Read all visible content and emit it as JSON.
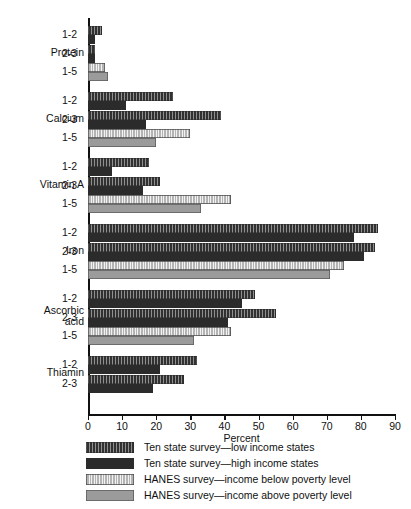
{
  "chart_data": {
    "type": "bar",
    "orientation": "horizontal",
    "title": "",
    "xlabel": "Percent",
    "ylabel": "",
    "xlim": [
      0,
      90
    ],
    "xticks": [
      0,
      10,
      20,
      30,
      40,
      50,
      60,
      70,
      80,
      90
    ],
    "xticklabels": [
      "0",
      "10",
      "20",
      "30",
      "40",
      "50",
      "60",
      "70",
      "80",
      "90"
    ],
    "grid": false,
    "legend_position": "below",
    "series": [
      {
        "name": "Ten state survey—low income states",
        "key": "tslow",
        "swatch": "dark-striped"
      },
      {
        "name": "Ten state survey—high income states",
        "key": "tshigh",
        "swatch": "dark-solid"
      },
      {
        "name": "HANES survey—income below poverty level",
        "key": "hbelow",
        "swatch": "light-striped"
      },
      {
        "name": "HANES survey—income above poverty level",
        "key": "habove",
        "swatch": "gray-solid"
      }
    ],
    "groups": [
      {
        "label": "Protein",
        "rows": [
          {
            "label": "1-2",
            "bars": [
              {
                "series": "tslow",
                "value": 4
              },
              {
                "series": "tshigh",
                "value": 2
              }
            ]
          },
          {
            "label": "2-3",
            "bars": [
              {
                "series": "tslow",
                "value": 2
              },
              {
                "series": "tshigh",
                "value": 2
              }
            ]
          },
          {
            "label": "1-5",
            "bars": [
              {
                "series": "hbelow",
                "value": 5
              },
              {
                "series": "habove",
                "value": 6
              }
            ]
          }
        ]
      },
      {
        "label": "Calcium",
        "rows": [
          {
            "label": "1-2",
            "bars": [
              {
                "series": "tslow",
                "value": 25
              },
              {
                "series": "tshigh",
                "value": 11
              }
            ]
          },
          {
            "label": "2-3",
            "bars": [
              {
                "series": "tslow",
                "value": 39
              },
              {
                "series": "tshigh",
                "value": 17
              }
            ]
          },
          {
            "label": "1-5",
            "bars": [
              {
                "series": "hbelow",
                "value": 30
              },
              {
                "series": "habove",
                "value": 20
              }
            ]
          }
        ]
      },
      {
        "label": "Vitamin A",
        "rows": [
          {
            "label": "1-2",
            "bars": [
              {
                "series": "tslow",
                "value": 18
              },
              {
                "series": "tshigh",
                "value": 7
              }
            ]
          },
          {
            "label": "2-3",
            "bars": [
              {
                "series": "tslow",
                "value": 21
              },
              {
                "series": "tshigh",
                "value": 16
              }
            ]
          },
          {
            "label": "1-5",
            "bars": [
              {
                "series": "hbelow",
                "value": 42
              },
              {
                "series": "habove",
                "value": 33
              }
            ]
          }
        ]
      },
      {
        "label": "Iron",
        "rows": [
          {
            "label": "1-2",
            "bars": [
              {
                "series": "tslow",
                "value": 85
              },
              {
                "series": "tshigh",
                "value": 78
              }
            ]
          },
          {
            "label": "2-3",
            "bars": [
              {
                "series": "tslow",
                "value": 84
              },
              {
                "series": "tshigh",
                "value": 81
              }
            ]
          },
          {
            "label": "1-5",
            "bars": [
              {
                "series": "hbelow",
                "value": 75
              },
              {
                "series": "habove",
                "value": 71
              }
            ]
          }
        ]
      },
      {
        "label": "Ascorbic\nacid",
        "rows": [
          {
            "label": "1-2",
            "bars": [
              {
                "series": "tslow",
                "value": 49
              },
              {
                "series": "tshigh",
                "value": 45
              }
            ]
          },
          {
            "label": "2-3",
            "bars": [
              {
                "series": "tslow",
                "value": 55
              },
              {
                "series": "tshigh",
                "value": 41
              }
            ]
          },
          {
            "label": "1-5",
            "bars": [
              {
                "series": "hbelow",
                "value": 42
              },
              {
                "series": "habove",
                "value": 31
              }
            ]
          }
        ]
      },
      {
        "label": "Thiamin",
        "rows": [
          {
            "label": "1-2",
            "bars": [
              {
                "series": "tslow",
                "value": 32
              },
              {
                "series": "tshigh",
                "value": 21
              }
            ]
          },
          {
            "label": "2-3",
            "bars": [
              {
                "series": "tslow",
                "value": 28
              },
              {
                "series": "tshigh",
                "value": 19
              }
            ]
          }
        ]
      }
    ]
  },
  "colors": {
    "axis": "#111111",
    "ten_state_low": "#3b3b3b",
    "ten_state_high": "#2b2b2b",
    "hanes_below": "#d9d9d9",
    "hanes_above": "#9b9b9b",
    "background": "#ffffff"
  }
}
